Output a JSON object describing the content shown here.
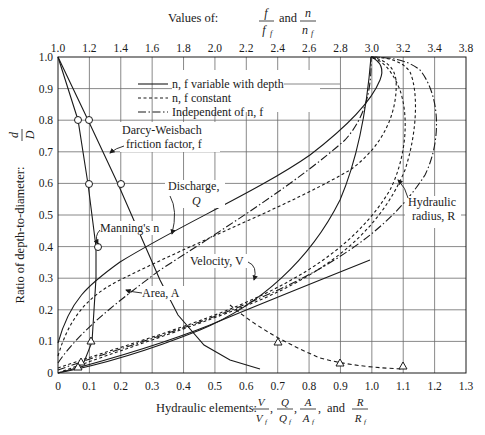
{
  "chart_data": {
    "type": "line",
    "title": "",
    "top_axis": {
      "label_prefix": "Values of:",
      "label_frac1_num": "f",
      "label_frac1_den": "f",
      "label_frac1_den_sub": "f",
      "label_and": "and",
      "label_frac2_num": "n",
      "label_frac2_den": "n",
      "label_frac2_den_sub": "f",
      "range": [
        1.0,
        3.8
      ],
      "ticks": [
        "1.0",
        "1.2",
        "1.4",
        "1.6",
        "1.8",
        "2.0",
        "2.2",
        "2.4",
        "2.6",
        "2.8",
        "3.0",
        "3.2",
        "3.4",
        "3.8"
      ]
    },
    "xlabel": "Hydraulic elements: V/Vf, Q/Qf, A/Af, and R/Rf",
    "xlabel_prefix": "Hydraulic elements:",
    "xlabel_and": "and",
    "xlim": [
      0,
      1.3
    ],
    "xticks": [
      "0",
      "0.1",
      "0.2",
      "0.3",
      "0.4",
      "0.5",
      "0.6",
      "0.7",
      "0.8",
      "0.9",
      "1.0",
      "1.1",
      "1.2",
      "1.3"
    ],
    "ylabel": "Ratio of depth-to-diameter:",
    "ylabel_frac_num": "d",
    "ylabel_frac_den": "D",
    "ylim": [
      0,
      1.0
    ],
    "yticks": [
      "0",
      "0.1",
      "0.2",
      "0.3",
      "0.4",
      "0.5",
      "0.6",
      "0.7",
      "0.8",
      "0.9",
      "1.0"
    ],
    "grid": true,
    "legend": [
      {
        "label": "n, f variable with depth",
        "style": "solid"
      },
      {
        "label": "n, f constant",
        "style": "dashed"
      },
      {
        "label": "Independent of n, f",
        "style": "dashdot"
      }
    ],
    "annotations": {
      "darcy_line1": "Darcy-Weisbach",
      "darcy_line2": "friction factor, f",
      "manning": "Manning's n",
      "discharge_line1": "Discharge,",
      "discharge_line2": "Q",
      "velocity": "Velocity, V",
      "area": "Area, A",
      "hydraulic_radius_line1": "Hydraulic",
      "hydraulic_radius_line2": "radius, R"
    },
    "series": [
      {
        "name": "Darcy-Weisbach f/f_f (top axis)",
        "axis": "top",
        "style": "solid-circles",
        "points": [
          [
            1.0,
            1.0
          ],
          [
            1.2,
            0.8
          ],
          [
            1.4,
            0.6
          ],
          [
            1.6,
            0.35
          ],
          [
            2.0,
            0.2
          ],
          [
            2.4,
            0.12
          ],
          [
            2.8,
            0.07
          ],
          [
            3.2,
            0.03
          ]
        ]
      },
      {
        "name": "Manning's n/n_f (top axis)",
        "axis": "top",
        "style": "solid-circles",
        "points": [
          [
            1.0,
            1.0
          ],
          [
            1.14,
            0.8
          ],
          [
            1.2,
            0.6
          ],
          [
            1.24,
            0.4
          ],
          [
            1.24,
            0.3
          ],
          [
            1.22,
            0.2
          ],
          [
            1.2,
            0.1
          ],
          [
            1.14,
            0.04
          ],
          [
            1.12,
            0.025
          ]
        ]
      },
      {
        "name": "Discharge Q - variable",
        "style": "solid",
        "points": [
          [
            0,
            0
          ],
          [
            0.1,
            0.2
          ],
          [
            0.2,
            0.3
          ],
          [
            0.3,
            0.37
          ],
          [
            0.4,
            0.44
          ],
          [
            0.5,
            0.5
          ],
          [
            0.6,
            0.56
          ],
          [
            0.7,
            0.63
          ],
          [
            0.8,
            0.7
          ],
          [
            0.9,
            0.78
          ],
          [
            0.98,
            0.87
          ],
          [
            1.02,
            0.95
          ],
          [
            1.0,
            1.0
          ]
        ]
      },
      {
        "name": "Discharge Q - constant",
        "style": "dashed",
        "points": [
          [
            0,
            0
          ],
          [
            0.1,
            0.16
          ],
          [
            0.2,
            0.25
          ],
          [
            0.3,
            0.32
          ],
          [
            0.4,
            0.39
          ],
          [
            0.5,
            0.44
          ],
          [
            0.6,
            0.5
          ],
          [
            0.7,
            0.56
          ],
          [
            0.8,
            0.62
          ],
          [
            0.9,
            0.69
          ],
          [
            1.0,
            0.76
          ],
          [
            1.07,
            0.85
          ],
          [
            1.08,
            0.94
          ],
          [
            1.0,
            1.0
          ]
        ]
      },
      {
        "name": "Velocity V - variable",
        "style": "solid",
        "points": [
          [
            0,
            0
          ],
          [
            0.1,
            0.02
          ],
          [
            0.2,
            0.05
          ],
          [
            0.3,
            0.09
          ],
          [
            0.4,
            0.14
          ],
          [
            0.5,
            0.2
          ],
          [
            0.6,
            0.28
          ],
          [
            0.7,
            0.38
          ],
          [
            0.8,
            0.5
          ],
          [
            0.9,
            0.63
          ],
          [
            0.96,
            0.75
          ],
          [
            1.0,
            0.88
          ],
          [
            1.0,
            1.0
          ]
        ]
      },
      {
        "name": "Velocity V - constant",
        "style": "dashed",
        "points": [
          [
            0,
            0
          ],
          [
            0.2,
            0.08
          ],
          [
            0.4,
            0.17
          ],
          [
            0.6,
            0.25
          ],
          [
            0.8,
            0.34
          ],
          [
            1.0,
            0.45
          ],
          [
            1.1,
            0.58
          ],
          [
            1.15,
            0.75
          ],
          [
            1.14,
            0.9
          ],
          [
            1.0,
            1.0
          ]
        ]
      },
      {
        "name": "Area A",
        "style": "dashdot",
        "points": [
          [
            0,
            0.02
          ],
          [
            0.1,
            0.12
          ],
          [
            0.2,
            0.2
          ],
          [
            0.3,
            0.27
          ],
          [
            0.4,
            0.33
          ],
          [
            0.5,
            0.4
          ],
          [
            0.6,
            0.47
          ],
          [
            0.7,
            0.55
          ],
          [
            0.8,
            0.64
          ],
          [
            0.9,
            0.74
          ],
          [
            0.97,
            0.87
          ],
          [
            1.0,
            1.0
          ]
        ]
      },
      {
        "name": "Hydraulic radius R",
        "style": "dashdot",
        "points": [
          [
            0,
            0
          ],
          [
            0.2,
            0.07
          ],
          [
            0.4,
            0.15
          ],
          [
            0.6,
            0.24
          ],
          [
            0.8,
            0.34
          ],
          [
            1.0,
            0.46
          ],
          [
            1.15,
            0.6
          ],
          [
            1.22,
            0.75
          ],
          [
            1.2,
            0.9
          ],
          [
            1.05,
            1.0
          ]
        ]
      },
      {
        "name": "Q with n constant (bottom, triangles)",
        "style": "dashed-triangles",
        "points": [
          [
            0.6,
            0.2
          ],
          [
            0.7,
            0.12
          ],
          [
            0.9,
            0.04
          ],
          [
            1.1,
            0.03
          ]
        ]
      }
    ]
  },
  "caption": {}
}
